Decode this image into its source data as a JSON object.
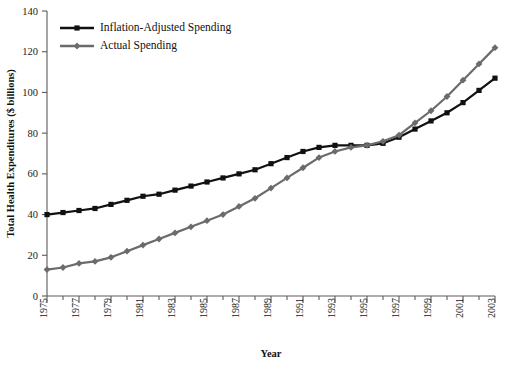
{
  "chart_data": {
    "type": "line",
    "title": "",
    "xlabel": "Year",
    "ylabel": "Total Health Expenditures ($ billions)",
    "xlim": [
      1975,
      2003
    ],
    "ylim": [
      0,
      140
    ],
    "yticks": [
      0,
      20,
      40,
      60,
      80,
      100,
      120,
      140
    ],
    "xticks": [
      1975,
      1977,
      1979,
      1981,
      1983,
      1985,
      1987,
      1989,
      1991,
      1993,
      1995,
      1997,
      1999,
      2001,
      2003
    ],
    "xtick_labels": [
      "1975",
      "1977",
      "1979",
      "1981",
      "1983",
      "1985",
      "1987",
      "1989",
      "1991",
      "1993",
      "1995",
      "1997",
      "1999",
      "2001",
      "2003"
    ],
    "ytick_labels": [
      "0",
      "20",
      "40",
      "60",
      "80",
      "100",
      "120",
      "140"
    ],
    "grid": false,
    "legend_position": "upper-left",
    "x": [
      1975,
      1976,
      1977,
      1978,
      1979,
      1980,
      1981,
      1982,
      1983,
      1984,
      1985,
      1986,
      1987,
      1988,
      1989,
      1990,
      1991,
      1992,
      1993,
      1994,
      1995,
      1996,
      1997,
      1998,
      1999,
      2000,
      2001,
      2002,
      2003
    ],
    "series": [
      {
        "name": "Inflation-Adjusted Spending",
        "color": "#111111",
        "marker": "square",
        "values": [
          40,
          41,
          42,
          43,
          45,
          47,
          49,
          50,
          52,
          54,
          56,
          58,
          60,
          62,
          65,
          68,
          71,
          73,
          74,
          74,
          74,
          75,
          78,
          82,
          86,
          90,
          95,
          101,
          107
        ]
      },
      {
        "name": "Actual Spending",
        "color": "#6b6b6b",
        "marker": "diamond",
        "values": [
          13,
          14,
          16,
          17,
          19,
          22,
          25,
          28,
          31,
          34,
          37,
          40,
          44,
          48,
          53,
          58,
          63,
          68,
          71,
          73,
          74,
          76,
          79,
          85,
          91,
          98,
          106,
          114,
          122
        ]
      }
    ]
  },
  "legend": {
    "items": [
      {
        "label": "Inflation-Adjusted Spending"
      },
      {
        "label": "Actual Spending"
      }
    ]
  }
}
